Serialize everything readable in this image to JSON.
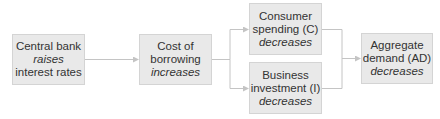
{
  "diagram": {
    "type": "flowchart",
    "nodes": [
      {
        "id": "cb",
        "line1": "Central bank",
        "line2": "raises",
        "line3": "interest rates",
        "italic_line": 2
      },
      {
        "id": "cost",
        "line1": "Cost of",
        "line2": "borrowing",
        "line3": "increases",
        "italic_line": 3
      },
      {
        "id": "c",
        "line1": "Consumer",
        "line2": "spending (C)",
        "line3": "decreases",
        "italic_line": 3
      },
      {
        "id": "i",
        "line1": "Business",
        "line2": "investment (I)",
        "line3": "decreases",
        "italic_line": 3
      },
      {
        "id": "ad",
        "line1": "Aggregate",
        "line2": "demand (AD)",
        "line3": "decreases",
        "italic_line": 3
      }
    ],
    "edges": [
      {
        "from": "cb",
        "to": "cost"
      },
      {
        "from": "cost",
        "to": "c"
      },
      {
        "from": "cost",
        "to": "i"
      },
      {
        "from": "c",
        "to": "ad"
      },
      {
        "from": "i",
        "to": "ad"
      }
    ],
    "colors": {
      "box_fill": "#e9e9e9",
      "box_border": "#d4d4d4",
      "line": "#c4c4c4",
      "text": "#333333"
    }
  }
}
